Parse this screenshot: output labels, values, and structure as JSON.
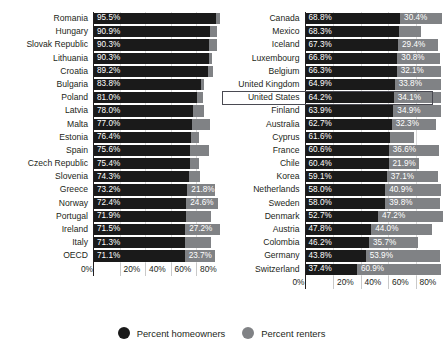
{
  "chart": {
    "title": "",
    "legend": [
      {
        "label": "Percent homeowners",
        "color": "#1a1a1a",
        "marker": "circle-dark"
      },
      {
        "label": "Percent renters",
        "color": "#808285",
        "marker": "circle-gray"
      }
    ],
    "axis": {
      "ticks": [
        "0%",
        "20%",
        "40%",
        "60%",
        "80%"
      ],
      "tick_values": [
        0,
        20,
        40,
        60,
        80
      ],
      "min": 0,
      "max": 100
    },
    "highlight": {
      "country": "United States",
      "panel": "right",
      "index": 6
    }
  },
  "chart_data": {
    "type": "bar",
    "orientation": "horizontal",
    "stacked": true,
    "title": "",
    "xlabel": "",
    "ylabel": "",
    "xlim": [
      0,
      100
    ],
    "grid": true,
    "legend_position": "bottom",
    "series": [
      {
        "name": "Percent homeowners",
        "color": "#1a1a1a"
      },
      {
        "name": "Percent renters",
        "color": "#808285"
      }
    ],
    "panels": [
      {
        "name": "left",
        "rows": [
          {
            "category": "Romania",
            "homeowners": 95.5,
            "homeowners_label": "95.5%",
            "renters": 3.0,
            "renters_label": ""
          },
          {
            "category": "Hungary",
            "homeowners": 90.9,
            "homeowners_label": "90.9%",
            "renters": 5.4,
            "renters_label": ""
          },
          {
            "category": "Slovak Republic",
            "homeowners": 90.3,
            "homeowners_label": "90.3%",
            "renters": 5.9,
            "renters_label": ""
          },
          {
            "category": "Lithuania",
            "homeowners": 90.3,
            "homeowners_label": "90.3%",
            "renters": 2.0,
            "renters_label": ""
          },
          {
            "category": "Croatia",
            "homeowners": 89.2,
            "homeowners_label": "89.2%",
            "renters": 4.5,
            "renters_label": ""
          },
          {
            "category": "Bulgaria",
            "homeowners": 83.8,
            "homeowners_label": "83.8%",
            "renters": 2.8,
            "renters_label": ""
          },
          {
            "category": "Poland",
            "homeowners": 81.0,
            "homeowners_label": "81.0%",
            "renters": 4.3,
            "renters_label": ""
          },
          {
            "category": "Latvia",
            "homeowners": 78.0,
            "homeowners_label": "78.0%",
            "renters": 8.6,
            "renters_label": ""
          },
          {
            "category": "Malta",
            "homeowners": 77.0,
            "homeowners_label": "77.0%",
            "renters": 14.0,
            "renters_label": ""
          },
          {
            "category": "Estonia",
            "homeowners": 76.4,
            "homeowners_label": "76.4%",
            "renters": 6.3,
            "renters_label": ""
          },
          {
            "category": "Spain",
            "homeowners": 75.6,
            "homeowners_label": "75.6%",
            "renters": 14.6,
            "renters_label": ""
          },
          {
            "category": "Czech Republic",
            "homeowners": 75.4,
            "homeowners_label": "75.4%",
            "renters": 6.8,
            "renters_label": ""
          },
          {
            "category": "Slovenia",
            "homeowners": 74.3,
            "homeowners_label": "74.3%",
            "renters": 9.1,
            "renters_label": ""
          },
          {
            "category": "Greece",
            "homeowners": 73.2,
            "homeowners_label": "73.2%",
            "renters": 21.8,
            "renters_label": "21.8%"
          },
          {
            "category": "Norway",
            "homeowners": 72.4,
            "homeowners_label": "72.4%",
            "renters": 24.6,
            "renters_label": "24.6%"
          },
          {
            "category": "Portugal",
            "homeowners": 71.9,
            "homeowners_label": "71.9%",
            "renters": 19.8,
            "renters_label": ""
          },
          {
            "category": "Ireland",
            "homeowners": 71.5,
            "homeowners_label": "71.5%",
            "renters": 27.2,
            "renters_label": "27.2%"
          },
          {
            "category": "Italy",
            "homeowners": 71.3,
            "homeowners_label": "71.3%",
            "renters": 20.4,
            "renters_label": ""
          },
          {
            "category": "OECD",
            "homeowners": 71.1,
            "homeowners_label": "71.1%",
            "renters": 23.7,
            "renters_label": "23.7%"
          }
        ]
      },
      {
        "name": "right",
        "rows": [
          {
            "category": "Canada",
            "homeowners": 68.8,
            "homeowners_label": "68.8%",
            "renters": 30.4,
            "renters_label": "30.4%"
          },
          {
            "category": "Mexico",
            "homeowners": 68.3,
            "homeowners_label": "68.3%",
            "renters": 15.5,
            "renters_label": ""
          },
          {
            "category": "Iceland",
            "homeowners": 67.3,
            "homeowners_label": "67.3%",
            "renters": 29.4,
            "renters_label": "29.4%"
          },
          {
            "category": "Luxembourg",
            "homeowners": 66.8,
            "homeowners_label": "66.8%",
            "renters": 30.8,
            "renters_label": "30.8%"
          },
          {
            "category": "Belgium",
            "homeowners": 66.3,
            "homeowners_label": "66.3%",
            "renters": 32.1,
            "renters_label": "32.1%"
          },
          {
            "category": "United Kingdom",
            "homeowners": 64.9,
            "homeowners_label": "64.9%",
            "renters": 33.8,
            "renters_label": "33.8%"
          },
          {
            "category": "United States",
            "homeowners": 64.2,
            "homeowners_label": "64.2%",
            "renters": 34.1,
            "renters_label": "34.1%"
          },
          {
            "category": "Finland",
            "homeowners": 63.9,
            "homeowners_label": "63.9%",
            "renters": 34.9,
            "renters_label": "34.9%"
          },
          {
            "category": "Australia",
            "homeowners": 62.7,
            "homeowners_label": "62.7%",
            "renters": 32.3,
            "renters_label": "32.3%"
          },
          {
            "category": "Cyprus",
            "homeowners": 61.6,
            "homeowners_label": "61.6%",
            "renters": 17.6,
            "renters_label": ""
          },
          {
            "category": "France",
            "homeowners": 60.6,
            "homeowners_label": "60.6%",
            "renters": 36.6,
            "renters_label": "36.6%"
          },
          {
            "category": "Chile",
            "homeowners": 60.4,
            "homeowners_label": "60.4%",
            "renters": 21.9,
            "renters_label": "21.9%"
          },
          {
            "category": "Korea",
            "homeowners": 59.1,
            "homeowners_label": "59.1%",
            "renters": 37.1,
            "renters_label": "37.1%"
          },
          {
            "category": "Netherlands",
            "homeowners": 58.0,
            "homeowners_label": "58.0%",
            "renters": 40.9,
            "renters_label": "40.9%"
          },
          {
            "category": "Sweden",
            "homeowners": 58.0,
            "homeowners_label": "58.0%",
            "renters": 39.8,
            "renters_label": "39.8%"
          },
          {
            "category": "Denmark",
            "homeowners": 52.7,
            "homeowners_label": "52.7%",
            "renters": 47.2,
            "renters_label": "47.2%"
          },
          {
            "category": "Austria",
            "homeowners": 47.8,
            "homeowners_label": "47.8%",
            "renters": 44.0,
            "renters_label": "44.0%"
          },
          {
            "category": "Colombia",
            "homeowners": 46.2,
            "homeowners_label": "46.2%",
            "renters": 35.7,
            "renters_label": "35.7%"
          },
          {
            "category": "Germany",
            "homeowners": 43.8,
            "homeowners_label": "43.8%",
            "renters": 53.9,
            "renters_label": "53.9%"
          },
          {
            "category": "Switzerland",
            "homeowners": 37.4,
            "homeowners_label": "37.4%",
            "renters": 60.9,
            "renters_label": "60.9%"
          }
        ]
      }
    ]
  }
}
